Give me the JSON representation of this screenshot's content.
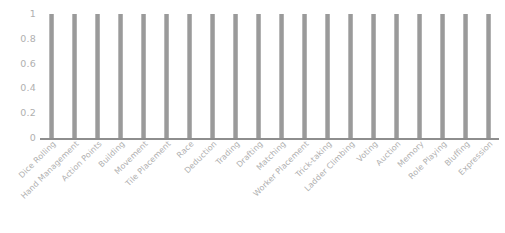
{
  "chart_data": {
    "type": "bar",
    "title": "",
    "subtitle": "",
    "xlabel": "",
    "ylabel": "",
    "grid": false,
    "legend": false,
    "legend_position": "none",
    "ylim": [
      0,
      1
    ],
    "y_ticks": [
      "0",
      "0.2",
      "0.4",
      "0.6",
      "0.8",
      "1"
    ],
    "y_tick_values": [
      0,
      0.2,
      0.4,
      0.6,
      0.8,
      1
    ],
    "bar_color": "#9a9a9a",
    "axis_color": "#8e8e8e",
    "tick_label_color": "#b0b0b0",
    "categories": [
      "Dice Rolling",
      "Hand Management",
      "Action Points",
      "Building",
      "Movement",
      "Tile Placement",
      "Race",
      "Deduction",
      "Trading",
      "Drafting",
      "Matching",
      "Worker Placement",
      "Trick-taking",
      "Ladder Climbing",
      "Voting",
      "Auction",
      "Memory",
      "Role Playing",
      "Bluffing",
      "Expression"
    ],
    "values": [
      1,
      1,
      1,
      1,
      1,
      1,
      1,
      1,
      1,
      1,
      1,
      1,
      1,
      1,
      1,
      1,
      1,
      1,
      1,
      1
    ]
  }
}
